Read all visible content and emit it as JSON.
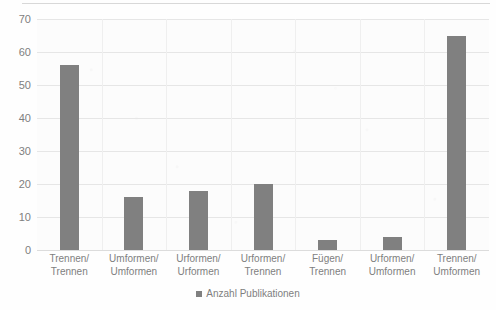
{
  "chart_data": {
    "type": "bar",
    "title": "",
    "xlabel": "",
    "ylabel": "",
    "ylim": [
      0,
      70
    ],
    "ytick_step": 10,
    "yticks": [
      "70",
      "60",
      "50",
      "40",
      "30",
      "20",
      "10",
      "0"
    ],
    "grid": true,
    "legend_position": "bottom-center",
    "series_name": "Anzahl Publikationen",
    "bar_color": "#808080",
    "categories": [
      "Trennen/ Trennen",
      "Umformen/ Umformen",
      "Urformen/ Urformen",
      "Urformen/ Trennen",
      "Fügen/ Trennen",
      "Urformen/ Umformen",
      "Trennen/ Umformen"
    ],
    "category_lines": [
      [
        "Trennen/",
        "Trennen"
      ],
      [
        "Umformen/",
        "Umformen"
      ],
      [
        "Urformen/",
        "Urformen"
      ],
      [
        "Urformen/",
        "Trennen"
      ],
      [
        "Fügen/ Trennen",
        ""
      ],
      [
        "Urformen/",
        "Umformen"
      ],
      [
        "Trennen/",
        "Umformen"
      ]
    ],
    "values": [
      56,
      16,
      18,
      20,
      3,
      4,
      65
    ]
  },
  "legend": {
    "marker": "square-swatch",
    "label": "Anzahl Publikationen"
  }
}
